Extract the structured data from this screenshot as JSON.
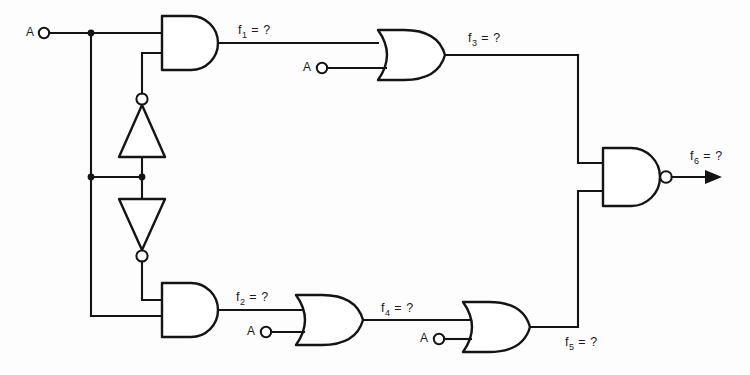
{
  "figure": {
    "type": "logic-circuit-diagram",
    "caption": "",
    "background_color": "#fdfdfd",
    "line_color": "#141414"
  },
  "inputs": [
    {
      "id": "a-top",
      "label": "A",
      "x": 30,
      "y": 33
    },
    {
      "id": "a-or-f3",
      "label": "A",
      "x": 303,
      "y": 68
    },
    {
      "id": "a-or-f4",
      "label": "A",
      "x": 248,
      "y": 330
    },
    {
      "id": "a-or-f5",
      "label": "A",
      "x": 421,
      "y": 345
    }
  ],
  "signals": [
    {
      "id": "f1",
      "base": "f",
      "sub": "1",
      "eq": " = ?",
      "text": "f1 = ?",
      "x": 238,
      "y": 24
    },
    {
      "id": "f2",
      "base": "f",
      "sub": "2",
      "eq": " = ?",
      "text": "f2 = ?",
      "x": 236,
      "y": 290
    },
    {
      "id": "f3",
      "base": "f",
      "sub": "3",
      "eq": " = ?",
      "text": "f3 = ?",
      "x": 468,
      "y": 31
    },
    {
      "id": "f4",
      "base": "f",
      "sub": "4",
      "eq": " = ?",
      "text": "f4 = ?",
      "x": 381,
      "y": 303
    },
    {
      "id": "f5",
      "base": "f",
      "sub": "5",
      "eq": " = ?",
      "text": "f5 = ?",
      "x": 565,
      "y": 341
    },
    {
      "id": "f6",
      "base": "f",
      "sub": "6",
      "eq": " = ?",
      "text": "f6 = ?",
      "x": 690,
      "y": 151
    }
  ],
  "gates": [
    {
      "id": "and-f1",
      "kind": "AND",
      "output": "f1",
      "x": 162,
      "y": 16,
      "w": 56,
      "h": 54
    },
    {
      "id": "and-f2",
      "kind": "AND",
      "output": "f2",
      "x": 162,
      "y": 283,
      "w": 56,
      "h": 54
    },
    {
      "id": "or-f3",
      "kind": "OR",
      "output": "f3",
      "x": 378,
      "y": 30,
      "w": 67,
      "h": 50
    },
    {
      "id": "or-f4",
      "kind": "OR",
      "output": "f4",
      "x": 296,
      "y": 295,
      "w": 67,
      "h": 50
    },
    {
      "id": "or-f5",
      "kind": "OR",
      "output": "f5",
      "x": 463,
      "y": 302,
      "w": 67,
      "h": 50
    },
    {
      "id": "nand-f6",
      "kind": "NAND",
      "output": "f6",
      "x": 603,
      "y": 148,
      "w": 57,
      "h": 58
    },
    {
      "id": "inv-up",
      "kind": "INVERTER",
      "output": "",
      "x": 119,
      "y": 97,
      "w": 46,
      "h": 60,
      "orientation": "up"
    },
    {
      "id": "inv-down",
      "kind": "INVERTER",
      "output": "",
      "x": 119,
      "y": 197,
      "w": 46,
      "h": 60,
      "orientation": "down"
    }
  ],
  "junctions": [
    {
      "id": "node-top-bus",
      "x": 91,
      "y": 33
    },
    {
      "id": "node-mid-left",
      "x": 91,
      "y": 177
    },
    {
      "id": "node-mid-right",
      "x": 142,
      "y": 177
    }
  ]
}
